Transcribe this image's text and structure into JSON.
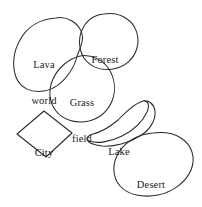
{
  "diagram": {
    "background_color": "#ffffff",
    "stroke_color": "#2b2b2b",
    "label_color": "#1a1a1a",
    "width": 202,
    "height": 207,
    "regions": [
      {
        "id": "lava-world",
        "label": "Lava\nworld",
        "label_line1": "Lava",
        "label_line2": "world",
        "shape": "blob",
        "label_x": 44,
        "label_y": 41
      },
      {
        "id": "forest",
        "label": "Forest",
        "label_line1": "Forest",
        "label_line2": "",
        "shape": "blob",
        "label_x": 105,
        "label_y": 36
      },
      {
        "id": "grass-field",
        "label": "Grass\nfield",
        "label_line1": "Grass",
        "label_line2": "field",
        "shape": "blob",
        "label_x": 82,
        "label_y": 79
      },
      {
        "id": "city",
        "label": "City",
        "label_line1": "City",
        "label_line2": "",
        "shape": "diamond",
        "label_x": 44,
        "label_y": 129
      },
      {
        "id": "lake",
        "label": "Lake",
        "label_line1": "Lake",
        "label_line2": "",
        "shape": "crescent",
        "label_x": 119,
        "label_y": 128
      },
      {
        "id": "desert",
        "label": "Desert",
        "label_line1": "Desert",
        "label_line2": "",
        "shape": "blob",
        "label_x": 151,
        "label_y": 161
      }
    ]
  }
}
